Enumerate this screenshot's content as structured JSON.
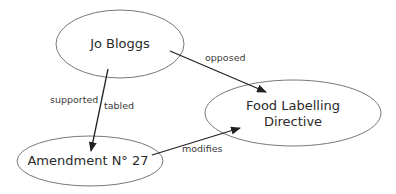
{
  "diagram": {
    "nodes": [
      {
        "id": "jo-bloggs",
        "label": "Jo Bloggs"
      },
      {
        "id": "food-labelling-directive",
        "label_line1": "Food Labelling",
        "label_line2": "Directive"
      },
      {
        "id": "amendment-27",
        "label": "Amendment N° 27"
      }
    ],
    "edges": [
      {
        "from": "jo-bloggs",
        "to": "food-labelling-directive",
        "label": "opposed"
      },
      {
        "from": "jo-bloggs",
        "to": "amendment-27",
        "label": "supported"
      },
      {
        "from": "jo-bloggs",
        "to": "amendment-27",
        "label": "tabled"
      },
      {
        "from": "amendment-27",
        "to": "food-labelling-directive",
        "label": "modifies"
      }
    ],
    "colors": {
      "stroke": "#555555",
      "arrow": "#222222",
      "text": "#2a2a2a"
    }
  }
}
